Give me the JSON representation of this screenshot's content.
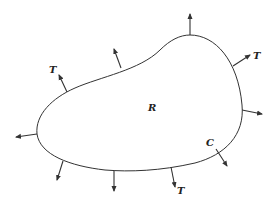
{
  "diagram": {
    "region_label": "R",
    "curve_label": "C",
    "traction_labels": [
      "T",
      "T",
      "T"
    ],
    "colors": {
      "stroke": "#333333",
      "background": "#ffffff"
    }
  }
}
